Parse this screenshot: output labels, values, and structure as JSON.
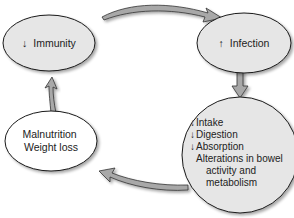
{
  "diagram": {
    "type": "cycle",
    "colors": {
      "node_fill_gray": "#e6e6e6",
      "node_fill_white": "#ffffff",
      "node_stroke": "#1a1a1a",
      "arrow_fill": "#a8a8a8",
      "arrow_stroke": "#333333",
      "text": "#222222"
    },
    "nodes": [
      {
        "id": "immunity",
        "arrow": "↓",
        "label": "Immunity"
      },
      {
        "id": "infection",
        "arrow": "↑",
        "label": "Infection"
      },
      {
        "id": "gi-effects",
        "lines": [
          {
            "arrow": "↓",
            "text": "Intake"
          },
          {
            "arrow": "↓",
            "text": "Digestion"
          },
          {
            "arrow": "↓",
            "text": "Absorption"
          },
          {
            "arrow": "",
            "text": "Alterations in bowel"
          },
          {
            "arrow": "",
            "text": "activity and"
          },
          {
            "arrow": "",
            "text": "metabolism"
          }
        ]
      },
      {
        "id": "malnutrition",
        "lines": [
          "Malnutrition",
          "Weight loss"
        ]
      }
    ],
    "edges": [
      {
        "from": "immunity",
        "to": "infection"
      },
      {
        "from": "infection",
        "to": "gi-effects"
      },
      {
        "from": "gi-effects",
        "to": "malnutrition"
      },
      {
        "from": "malnutrition",
        "to": "immunity"
      }
    ]
  }
}
